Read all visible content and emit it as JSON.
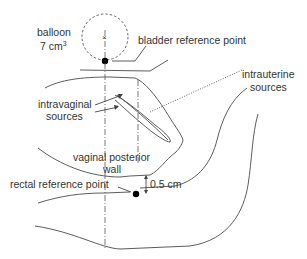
{
  "diagram": {
    "type": "anatomical schematic",
    "labels": {
      "balloon_line1": "balloon",
      "balloon_line2": "7 cm",
      "balloon_sup": "3",
      "bladder_ref": "bladder reference point",
      "intrauterine_line1": "intrauterine",
      "intrauterine_line2": "sources",
      "intravaginal_line1": "intravaginal",
      "intravaginal_line2": "sources",
      "vaginal_wall_line1": "vaginal posterior",
      "vaginal_wall_line2": "wall",
      "rectal_ref": "rectal reference point",
      "distance": "0.5 cm"
    },
    "colors": {
      "line": "#4a4a4a",
      "text": "#333333",
      "point": "#000000"
    }
  }
}
